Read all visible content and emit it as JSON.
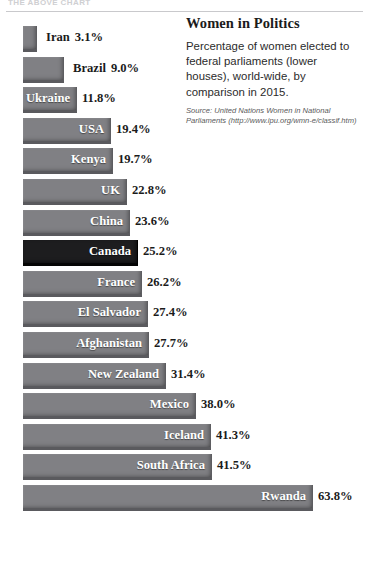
{
  "page": {
    "cropped_header_text": "THE ABOVE CHART",
    "background_color": "#ffffff"
  },
  "info_panel": {
    "title": "Women in Politics",
    "description": "Percentage of women elected to federal parliaments (lower houses), world-wide, by comparison in 2015.",
    "source": "Source: United Nations Women in National Parliaments (http://www.ipu.org/wmn-e/classif.htm)"
  },
  "chart_data": {
    "type": "bar",
    "orientation": "horizontal",
    "title": "Women in Politics",
    "xlabel": "",
    "ylabel": "",
    "xlim": [
      0,
      63.8
    ],
    "grid": false,
    "legend": false,
    "value_suffix": "%",
    "highlight_color": "#1d1d1f",
    "bar_color": "#808084",
    "highlighted_category": "Canada",
    "categories": [
      "Iran",
      "Brazil",
      "Ukraine",
      "USA",
      "Kenya",
      "UK",
      "China",
      "Canada",
      "France",
      "El Salvador",
      "Afghanistan",
      "New Zealand",
      "Mexico",
      "Iceland",
      "South Africa",
      "Rwanda"
    ],
    "values": [
      3.1,
      9.0,
      11.8,
      19.4,
      19.7,
      22.8,
      23.6,
      25.2,
      26.2,
      27.4,
      27.7,
      31.4,
      38.0,
      41.3,
      41.5,
      63.8
    ],
    "bars": [
      {
        "country": "Iran",
        "value": 3.1,
        "value_text": "3.1%",
        "label_inside": false,
        "highlight": false
      },
      {
        "country": "Brazil",
        "value": 9.0,
        "value_text": "9.0%",
        "label_inside": false,
        "highlight": false
      },
      {
        "country": "Ukraine",
        "value": 11.8,
        "value_text": "11.8%",
        "label_inside": true,
        "highlight": false
      },
      {
        "country": "USA",
        "value": 19.4,
        "value_text": "19.4%",
        "label_inside": true,
        "highlight": false
      },
      {
        "country": "Kenya",
        "value": 19.7,
        "value_text": "19.7%",
        "label_inside": true,
        "highlight": false
      },
      {
        "country": "UK",
        "value": 22.8,
        "value_text": "22.8%",
        "label_inside": true,
        "highlight": false
      },
      {
        "country": "China",
        "value": 23.6,
        "value_text": "23.6%",
        "label_inside": true,
        "highlight": false
      },
      {
        "country": "Canada",
        "value": 25.2,
        "value_text": "25.2%",
        "label_inside": true,
        "highlight": true
      },
      {
        "country": "France",
        "value": 26.2,
        "value_text": "26.2%",
        "label_inside": true,
        "highlight": false
      },
      {
        "country": "El Salvador",
        "value": 27.4,
        "value_text": "27.4%",
        "label_inside": true,
        "highlight": false
      },
      {
        "country": "Afghanistan",
        "value": 27.7,
        "value_text": "27.7%",
        "label_inside": true,
        "highlight": false
      },
      {
        "country": "New Zealand",
        "value": 31.4,
        "value_text": "31.4%",
        "label_inside": true,
        "highlight": false
      },
      {
        "country": "Mexico",
        "value": 38.0,
        "value_text": "38.0%",
        "label_inside": true,
        "highlight": false
      },
      {
        "country": "Iceland",
        "value": 41.3,
        "value_text": "41.3%",
        "label_inside": true,
        "highlight": false
      },
      {
        "country": "South Africa",
        "value": 41.5,
        "value_text": "41.5%",
        "label_inside": true,
        "highlight": false
      },
      {
        "country": "Rwanda",
        "value": 63.8,
        "value_text": "63.8%",
        "label_inside": true,
        "highlight": false
      }
    ]
  }
}
